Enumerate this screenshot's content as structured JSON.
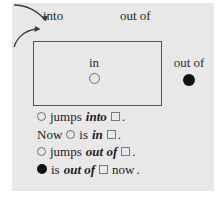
{
  "figure": {
    "background_color": "#e8e8e8",
    "page_background_color": "#ffffff",
    "stroke_color": "#555555",
    "text_color": "#1c1c1c",
    "filled_marker_color": "#111111",
    "open_marker_color": "#6e6e6e"
  },
  "annotations": {
    "into_label": "into",
    "out_of_label": "out of"
  },
  "diagram": {
    "inside_label": "in",
    "inside_marker": "open-circle",
    "outside_label": "out of",
    "outside_marker": "filled-circle",
    "container": "rectangle"
  },
  "sentences": [
    {
      "tokens": [
        {
          "type": "open-circle"
        },
        {
          "type": "text",
          "text": "jumps"
        },
        {
          "type": "emphasis",
          "text": "into"
        },
        {
          "type": "square"
        },
        {
          "type": "period",
          "text": "."
        }
      ]
    },
    {
      "tokens": [
        {
          "type": "text",
          "text": "Now"
        },
        {
          "type": "open-circle"
        },
        {
          "type": "text",
          "text": "is"
        },
        {
          "type": "emphasis",
          "text": "in"
        },
        {
          "type": "square"
        },
        {
          "type": "period",
          "text": "."
        }
      ]
    },
    {
      "tokens": [
        {
          "type": "open-circle"
        },
        {
          "type": "text",
          "text": "jumps"
        },
        {
          "type": "emphasis",
          "text": "out of"
        },
        {
          "type": "square"
        },
        {
          "type": "period",
          "text": "."
        }
      ]
    },
    {
      "tokens": [
        {
          "type": "filled-circle"
        },
        {
          "type": "text",
          "text": "is"
        },
        {
          "type": "emphasis",
          "text": "out of"
        },
        {
          "type": "square"
        },
        {
          "type": "text",
          "text": "now"
        },
        {
          "type": "period",
          "text": "."
        }
      ]
    }
  ]
}
